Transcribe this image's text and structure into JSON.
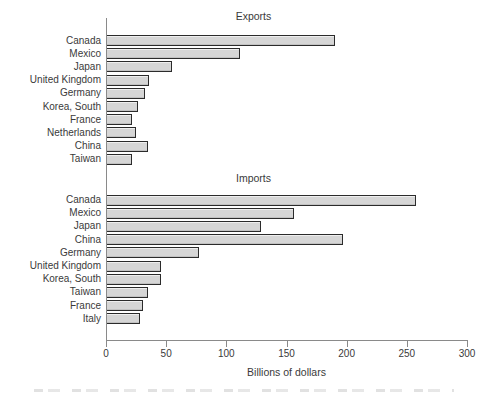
{
  "figure": {
    "xlabel": "Billions of dollars",
    "background": "#ffffff"
  },
  "chart_data": [
    {
      "type": "bar",
      "orientation": "horizontal",
      "title": "Exports",
      "categories": [
        "Canada",
        "Mexico",
        "Japan",
        "United Kingdom",
        "Germany",
        "Korea, South",
        "France",
        "Netherlands",
        "China",
        "Taiwan"
      ],
      "values": [
        190,
        111,
        55,
        36,
        32,
        27,
        22,
        25,
        35,
        22
      ],
      "xlabel": "Billions of dollars",
      "xlim": [
        0,
        300
      ],
      "xticks": [
        0,
        50,
        100,
        150,
        200,
        250,
        300
      ],
      "grid": false,
      "legend": "none"
    },
    {
      "type": "bar",
      "orientation": "horizontal",
      "title": "Imports",
      "categories": [
        "Canada",
        "Mexico",
        "Japan",
        "China",
        "Germany",
        "United Kingdom",
        "Korea, South",
        "Taiwan",
        "France",
        "Italy"
      ],
      "values": [
        258,
        156,
        129,
        197,
        77,
        46,
        46,
        35,
        31,
        28
      ],
      "xlabel": "Billions of dollars",
      "xlim": [
        0,
        300
      ],
      "xticks": [
        0,
        50,
        100,
        150,
        200,
        250,
        300
      ],
      "grid": false,
      "legend": "none"
    }
  ],
  "colors": {
    "bar_fill": "#d6d6d6",
    "bar_border": "#2b2b2b",
    "axis": "#8a8a8a",
    "text": "#3a3a3a",
    "background": "#ffffff"
  }
}
